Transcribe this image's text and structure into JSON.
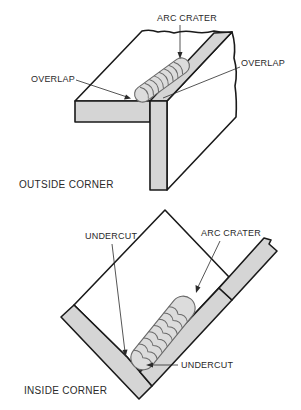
{
  "figures": {
    "outside_corner": {
      "caption": "OUTSIDE CORNER",
      "labels": {
        "arc_crater": "ARC CRATER",
        "overlap_left": "OVERLAP",
        "overlap_right": "OVERLAP"
      }
    },
    "inside_corner": {
      "caption": "INSIDE CORNER",
      "labels": {
        "undercut_top": "UNDERCUT",
        "arc_crater": "ARC CRATER",
        "undercut_bottom": "UNDERCUT"
      }
    }
  },
  "colors": {
    "plate_fill": "#d5d5d5",
    "bead_fill": "#dcdcdc",
    "line": "#1a1a1a"
  }
}
